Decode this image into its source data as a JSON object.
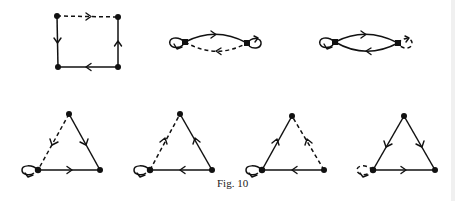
{
  "caption": "Fig. 10",
  "colors": {
    "ink": "#111111",
    "background": "#ffffff"
  },
  "diagrams": [
    {
      "id": "square",
      "nodes": [
        [
          57,
          16
        ],
        [
          118,
          17
        ],
        [
          118,
          67
        ],
        [
          58,
          67
        ]
      ],
      "edges": [
        {
          "from": 0,
          "to": 1,
          "style": "dashed",
          "dir": "forward"
        },
        {
          "from": 1,
          "to": 2,
          "style": "solid",
          "dir": "up"
        },
        {
          "from": 2,
          "to": 3,
          "style": "solid",
          "dir": "left"
        },
        {
          "from": 0,
          "to": 3,
          "style": "solid",
          "dir": "down"
        }
      ]
    },
    {
      "id": "two-node-a",
      "nodes": [
        [
          185,
          42
        ],
        [
          247,
          43
        ]
      ],
      "edges": [
        {
          "type": "arc-top",
          "style": "solid",
          "dir": "right"
        },
        {
          "type": "arc-bottom",
          "style": "dashed",
          "dir": "left"
        },
        {
          "type": "loop-left",
          "node": 0,
          "style": "solid"
        },
        {
          "type": "loop-right",
          "node": 1,
          "style": "solid"
        }
      ]
    },
    {
      "id": "two-node-b",
      "nodes": [
        [
          335,
          42
        ],
        [
          398,
          43
        ]
      ],
      "edges": [
        {
          "type": "arc-top",
          "style": "solid",
          "dir": "right"
        },
        {
          "type": "arc-bottom",
          "style": "solid",
          "dir": "left"
        },
        {
          "type": "loop-left",
          "node": 0,
          "style": "solid"
        },
        {
          "type": "loop-right",
          "node": 1,
          "style": "dashed"
        }
      ]
    },
    {
      "id": "triangle-1",
      "nodes": [
        [
          69,
          114
        ],
        [
          38,
          170
        ],
        [
          100,
          170
        ]
      ],
      "edges": [
        {
          "from": 0,
          "to": 1,
          "style": "dashed",
          "dir": "down"
        },
        {
          "from": 0,
          "to": 2,
          "style": "solid",
          "dir": "down"
        },
        {
          "from": 1,
          "to": 2,
          "style": "solid",
          "dir": "right"
        },
        {
          "type": "loop-left",
          "node": 1,
          "style": "solid"
        }
      ]
    },
    {
      "id": "triangle-2",
      "nodes": [
        [
          180,
          114
        ],
        [
          150,
          170
        ],
        [
          212,
          170
        ]
      ],
      "edges": [
        {
          "from": 1,
          "to": 0,
          "style": "dashed",
          "dir": "up"
        },
        {
          "from": 2,
          "to": 0,
          "style": "solid",
          "dir": "up"
        },
        {
          "from": 2,
          "to": 1,
          "style": "solid",
          "dir": "left"
        },
        {
          "type": "loop-left",
          "node": 1,
          "style": "solid"
        }
      ]
    },
    {
      "id": "triangle-3",
      "nodes": [
        [
          292,
          116
        ],
        [
          262,
          170
        ],
        [
          324,
          170
        ]
      ],
      "edges": [
        {
          "from": 1,
          "to": 0,
          "style": "solid",
          "dir": "up"
        },
        {
          "from": 2,
          "to": 0,
          "style": "dashed",
          "dir": "up"
        },
        {
          "from": 2,
          "to": 1,
          "style": "solid",
          "dir": "left"
        },
        {
          "type": "loop-left",
          "node": 1,
          "style": "solid"
        }
      ]
    },
    {
      "id": "triangle-4",
      "nodes": [
        [
          404,
          116
        ],
        [
          373,
          170
        ],
        [
          435,
          170
        ]
      ],
      "edges": [
        {
          "from": 0,
          "to": 1,
          "style": "solid",
          "dir": "down"
        },
        {
          "from": 0,
          "to": 2,
          "style": "solid",
          "dir": "down"
        },
        {
          "from": 1,
          "to": 2,
          "style": "solid",
          "dir": "right"
        },
        {
          "type": "loop-left",
          "node": 1,
          "style": "dashed"
        }
      ]
    }
  ]
}
